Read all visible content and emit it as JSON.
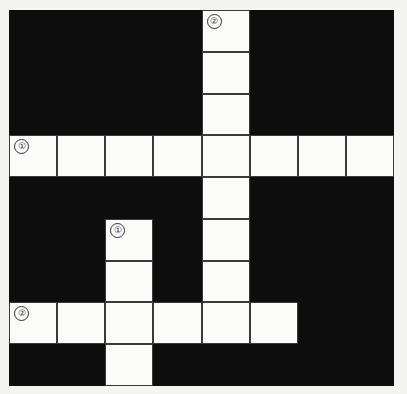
{
  "puzzle": {
    "type": "crossword",
    "rows": 9,
    "cols": 8,
    "colors": {
      "block": "#0d0d0d",
      "cell": "#fbfbfa",
      "border": "#3a3a3a"
    },
    "grid": [
      "....#...",
      "....#...",
      "....#...",
      "########",
      "..#.#...",
      "..#.#...",
      "..#.#...",
      "######..",
      "..#....."
    ],
    "white_cells": [
      [
        0,
        4
      ],
      [
        1,
        4
      ],
      [
        2,
        4
      ],
      [
        3,
        0
      ],
      [
        3,
        1
      ],
      [
        3,
        2
      ],
      [
        3,
        3
      ],
      [
        3,
        4
      ],
      [
        3,
        5
      ],
      [
        3,
        6
      ],
      [
        3,
        7
      ],
      [
        4,
        4
      ],
      [
        5,
        2
      ],
      [
        5,
        4
      ],
      [
        6,
        2
      ],
      [
        6,
        4
      ],
      [
        7,
        0
      ],
      [
        7,
        1
      ],
      [
        7,
        2
      ],
      [
        7,
        3
      ],
      [
        7,
        4
      ],
      [
        7,
        5
      ],
      [
        8,
        2
      ]
    ],
    "clue_numbers": [
      {
        "label": "②",
        "row": 0,
        "col": 4,
        "direction": "down",
        "length": 8
      },
      {
        "label": "①",
        "row": 3,
        "col": 0,
        "direction": "across",
        "length": 8
      },
      {
        "label": "①",
        "row": 5,
        "col": 2,
        "direction": "down",
        "length": 4
      },
      {
        "label": "②",
        "row": 7,
        "col": 0,
        "direction": "across",
        "length": 6
      }
    ],
    "answers": {}
  }
}
